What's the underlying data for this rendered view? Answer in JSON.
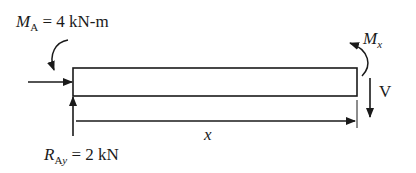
{
  "diagram": {
    "type": "free-body-diagram",
    "labels": {
      "moment_A_symbol": "M",
      "moment_A_subscript": "A",
      "moment_A_value": " = 4 kN-m",
      "reaction_symbol": "R",
      "reaction_subscript_A": "A",
      "reaction_subscript_y": "y",
      "reaction_value": " = 2 kN",
      "moment_x_symbol": "M",
      "moment_x_subscript": "x",
      "shear_label": "V",
      "distance_label": "x"
    },
    "elements": [
      {
        "name": "beam",
        "shape": "rectangle"
      },
      {
        "name": "moment-A",
        "direction": "clockwise",
        "position": "left end"
      },
      {
        "name": "horizontal-force",
        "direction": "right",
        "position": "left end"
      },
      {
        "name": "reaction-Ay",
        "direction": "up",
        "position": "left end"
      },
      {
        "name": "moment-Mx",
        "direction": "counter-clockwise",
        "position": "right end"
      },
      {
        "name": "shear-V",
        "direction": "down",
        "position": "right end"
      },
      {
        "name": "dimension-x",
        "from": "left end",
        "to": "right end"
      }
    ],
    "colors": {
      "ink": "#1a1a1a",
      "background": "#ffffff"
    }
  }
}
